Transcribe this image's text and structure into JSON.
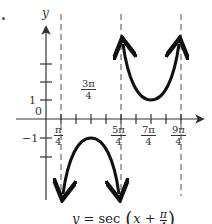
{
  "figure": {
    "marker_dot": ".",
    "axis_labels": {
      "y": "y",
      "origin": "0"
    },
    "y_tick_labels": {
      "pos1": "1",
      "neg1": "−1"
    },
    "x_tick_labels": [
      {
        "num": "π",
        "den": "4",
        "position": "below"
      },
      {
        "num": "3π",
        "den": "4",
        "position": "above"
      },
      {
        "num": "5π",
        "den": "4",
        "position": "below"
      },
      {
        "num": "7π",
        "den": "4",
        "position": "below"
      },
      {
        "num": "9π",
        "den": "4",
        "position": "below"
      }
    ],
    "caption": {
      "lhs": "y",
      "eq": " = sec ",
      "var": "x",
      "plus": " + ",
      "frac_num": "π",
      "frac_den": "4"
    },
    "asymptotes": [
      "π/4",
      "5π/4",
      "9π/4"
    ],
    "curve_color": "#111111",
    "axis_color": "#444444",
    "asymptote_color": "#777777"
  }
}
